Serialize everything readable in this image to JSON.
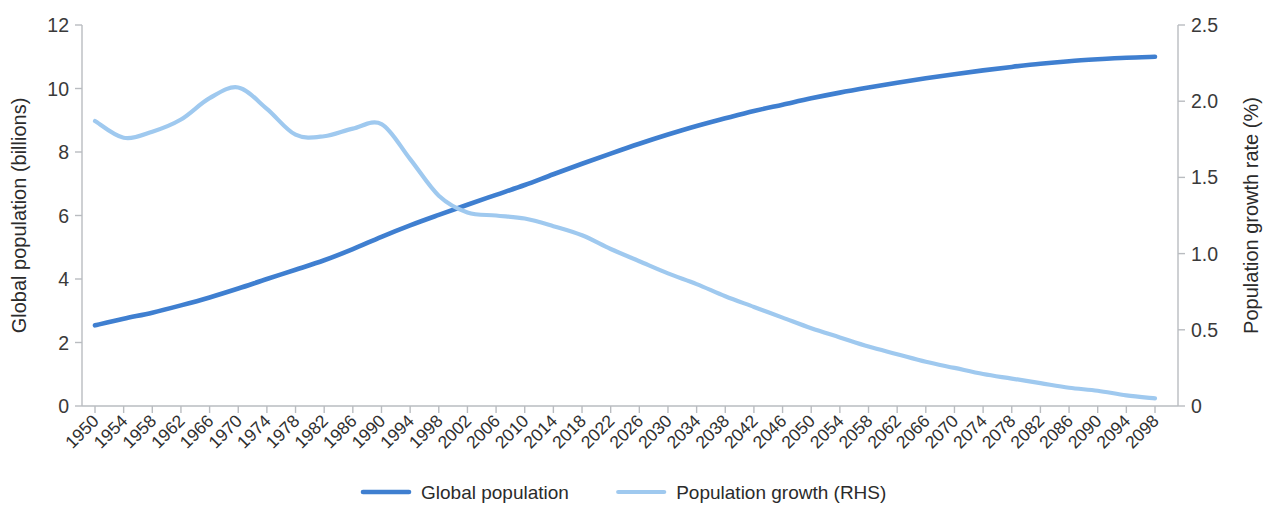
{
  "chart_data": {
    "type": "line",
    "title": "",
    "subtitle": "",
    "xlabel": "",
    "grid": false,
    "legend_position": "bottom",
    "x_tick_labels": [
      "1950",
      "1954",
      "1958",
      "1962",
      "1966",
      "1970",
      "1974",
      "1978",
      "1982",
      "1986",
      "1990",
      "1994",
      "1998",
      "2002",
      "2006",
      "2010",
      "2014",
      "2018",
      "2022",
      "2026",
      "2030",
      "2034",
      "2038",
      "2042",
      "2046",
      "2050",
      "2054",
      "2058",
      "2062",
      "2066",
      "2070",
      "2074",
      "2078",
      "2082",
      "2086",
      "2090",
      "2094",
      "2098"
    ],
    "x_tick_rotation": -45,
    "xlim": [
      1950,
      2100
    ],
    "axes": [
      {
        "id": "left",
        "label": "Global population (billions)",
        "ticks": [
          "0",
          "2",
          "4",
          "6",
          "8",
          "10",
          "12"
        ],
        "tick_values": [
          0,
          2,
          4,
          6,
          8,
          10,
          12
        ],
        "lim": [
          0,
          12
        ]
      },
      {
        "id": "right",
        "label": "Population growth rate (%)",
        "ticks": [
          "0",
          "0.5",
          "1.0",
          "1.5",
          "2.0",
          "2.5"
        ],
        "tick_values": [
          0,
          0.5,
          1.0,
          1.5,
          2.0,
          2.5
        ],
        "lim": [
          0,
          2.5
        ]
      }
    ],
    "series": [
      {
        "name": "Global population",
        "legend_label": "Global population",
        "axis": "left",
        "color": "#3f7fd0",
        "stroke_width": 4.6,
        "unit": "billions",
        "x": [
          1950,
          1954,
          1958,
          1962,
          1966,
          1970,
          1974,
          1978,
          1982,
          1986,
          1990,
          1994,
          1998,
          2002,
          2006,
          2010,
          2014,
          2018,
          2022,
          2026,
          2030,
          2034,
          2038,
          2042,
          2046,
          2050,
          2054,
          2058,
          2062,
          2066,
          2070,
          2074,
          2078,
          2082,
          2086,
          2090,
          2094,
          2098
        ],
        "values": [
          2.54,
          2.75,
          2.94,
          3.17,
          3.42,
          3.7,
          4.0,
          4.29,
          4.59,
          4.94,
          5.33,
          5.69,
          6.02,
          6.34,
          6.65,
          6.96,
          7.3,
          7.63,
          7.95,
          8.26,
          8.55,
          8.82,
          9.06,
          9.29,
          9.49,
          9.69,
          9.87,
          10.03,
          10.18,
          10.32,
          10.45,
          10.57,
          10.68,
          10.78,
          10.86,
          10.92,
          10.97,
          11.0
        ]
      },
      {
        "name": "Population growth (RHS)",
        "legend_label": "Population growth (RHS)",
        "axis": "right",
        "color": "#9fc9ef",
        "stroke_width": 4.2,
        "unit": "%",
        "x": [
          1950,
          1954,
          1958,
          1962,
          1966,
          1970,
          1974,
          1978,
          1982,
          1986,
          1990,
          1994,
          1998,
          2002,
          2006,
          2010,
          2014,
          2018,
          2022,
          2026,
          2030,
          2034,
          2038,
          2042,
          2046,
          2050,
          2054,
          2058,
          2062,
          2066,
          2070,
          2074,
          2078,
          2082,
          2086,
          2090,
          2094,
          2098
        ],
        "values": [
          1.87,
          1.76,
          1.8,
          1.88,
          2.02,
          2.09,
          1.95,
          1.78,
          1.77,
          1.82,
          1.85,
          1.62,
          1.38,
          1.27,
          1.25,
          1.23,
          1.18,
          1.12,
          1.03,
          0.95,
          0.87,
          0.8,
          0.72,
          0.65,
          0.58,
          0.51,
          0.45,
          0.39,
          0.34,
          0.29,
          0.25,
          0.21,
          0.18,
          0.15,
          0.12,
          0.1,
          0.07,
          0.05
        ]
      }
    ]
  }
}
